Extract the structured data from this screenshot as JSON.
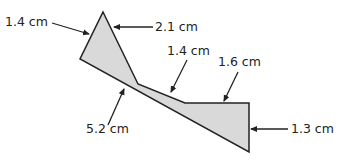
{
  "diagram": {
    "type": "composite-polygon",
    "fill_color": "#d9d9d9",
    "stroke_color": "#222222",
    "labels": {
      "left_top_side": "1.4 cm",
      "right_top_side": "2.1 cm",
      "middle_top_side": "1.4 cm",
      "right_horizontal_side": "1.6 cm",
      "bottom_long_side": "5.2 cm",
      "right_vertical_side": "1.3 cm"
    }
  }
}
